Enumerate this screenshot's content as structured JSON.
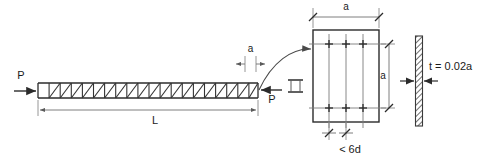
{
  "figure": {
    "type": "engineering-diagram",
    "title": "",
    "background_color": "#ffffff",
    "line_color": "#333333",
    "text_color": "#1a1a1a",
    "labels": {
      "load_left": "P",
      "load_right": "P",
      "span_length": "L",
      "cell_width": "a",
      "section_width": "a",
      "section_height": "a",
      "spacing_note": "< 6d",
      "thickness_note": "t = 0.02a"
    },
    "truss": {
      "bay_count": 19,
      "description": "pin-jointed truss beam with diagonal web members",
      "x_start": 38,
      "x_end": 258,
      "y_top": 83,
      "y_bottom": 98
    },
    "cross_section": {
      "description": "rectangular member cross-section with internal grid",
      "vertical_grid_lines": 3,
      "horizontal_grid_lines": 2,
      "x_left": 313,
      "x_right": 379,
      "y_top": 30,
      "y_bottom": 122
    },
    "plate": {
      "description": "thin hatched plate elevation",
      "x_center": 419,
      "y_top": 36,
      "y_bottom": 126
    }
  }
}
